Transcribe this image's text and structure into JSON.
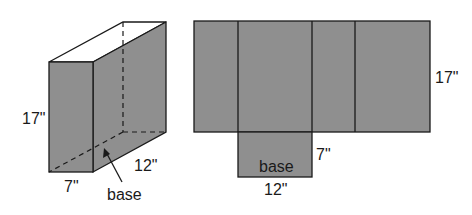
{
  "colors": {
    "face": "#8f8f8f",
    "top": "#ffffff",
    "stroke": "#1a1a1a"
  },
  "prism": {
    "height_label": "17\"",
    "width_label": "7\"",
    "depth_label": "12\"",
    "base_label": "base"
  },
  "net": {
    "height_label": "17\"",
    "base_width_label": "12\"",
    "base_depth_label": "7\"",
    "base_label": "base"
  }
}
